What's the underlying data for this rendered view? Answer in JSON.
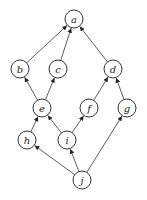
{
  "diagram": {
    "type": "directed-acyclic-graph",
    "nodes": [
      {
        "id": "a",
        "label": "a",
        "x": 74,
        "y": 19
      },
      {
        "id": "b",
        "label": "b",
        "x": 20,
        "y": 69
      },
      {
        "id": "c",
        "label": "c",
        "x": 58,
        "y": 69
      },
      {
        "id": "d",
        "label": "d",
        "x": 113,
        "y": 69
      },
      {
        "id": "e",
        "label": "e",
        "x": 42,
        "y": 108
      },
      {
        "id": "f",
        "label": "f",
        "x": 89,
        "y": 108
      },
      {
        "id": "g",
        "label": "g",
        "x": 127,
        "y": 108
      },
      {
        "id": "h",
        "label": "h",
        "x": 27,
        "y": 140
      },
      {
        "id": "i",
        "label": "i",
        "x": 67,
        "y": 140
      },
      {
        "id": "j",
        "label": "j",
        "x": 82,
        "y": 180
      }
    ],
    "edges": [
      {
        "from": "b",
        "to": "a"
      },
      {
        "from": "c",
        "to": "a"
      },
      {
        "from": "d",
        "to": "a"
      },
      {
        "from": "e",
        "to": "b"
      },
      {
        "from": "e",
        "to": "c"
      },
      {
        "from": "f",
        "to": "d"
      },
      {
        "from": "g",
        "to": "d"
      },
      {
        "from": "h",
        "to": "e"
      },
      {
        "from": "i",
        "to": "e"
      },
      {
        "from": "i",
        "to": "f"
      },
      {
        "from": "j",
        "to": "h"
      },
      {
        "from": "j",
        "to": "i"
      },
      {
        "from": "j",
        "to": "g"
      }
    ]
  }
}
